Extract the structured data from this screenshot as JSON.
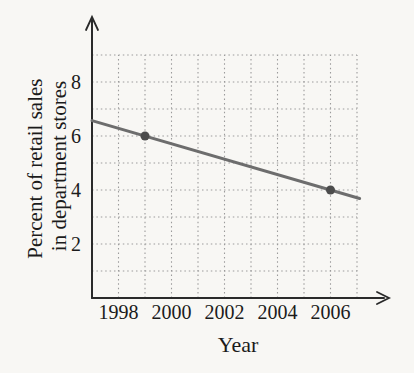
{
  "chart_data": {
    "type": "line",
    "title": "",
    "xlabel": "Year",
    "ylabel": "Percent of retail sales in department stores",
    "ylabel_lines": [
      "Percent of retail sales",
      "in department stores"
    ],
    "x_ticks": [
      "1998",
      "2000",
      "2002",
      "2004",
      "2006"
    ],
    "y_ticks": [
      "2",
      "4",
      "6",
      "8"
    ],
    "x_grid": {
      "start": 1998,
      "end": 2007,
      "step": 1
    },
    "y_grid": {
      "start": 1,
      "end": 9,
      "step": 1
    },
    "x_axis_range": [
      1997,
      2007.5
    ],
    "y_axis_range": [
      0,
      10
    ],
    "grid_style": "dotted",
    "legend_position": "none",
    "series": [
      {
        "name": "percent of retail sales in department stores",
        "points": [
          {
            "x": 1999,
            "y": 6
          },
          {
            "x": 2006,
            "y": 4
          }
        ],
        "slope_per_year": -0.2857,
        "line_extent": {
          "x_start": 1997,
          "x_end": 2007.1
        }
      }
    ],
    "colors": {
      "background": "#f8f7f4",
      "axis": "#2a2a2a",
      "grid": "#9c9c9c",
      "line": "#6d6d6d",
      "point": "#4c4c4c",
      "text": "#1b1b1b"
    }
  }
}
